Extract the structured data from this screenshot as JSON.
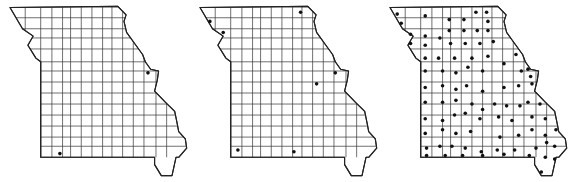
{
  "figure": {
    "title": "",
    "region": "Missouri counties",
    "colors": {
      "line": "#222222",
      "dot": "#111111",
      "background": "#ffffff"
    }
  },
  "maps": [
    {
      "name": "map-1",
      "occurrences": [
        {
          "lon": -90.6,
          "lat": 38.8,
          "label": "St. Charles area"
        },
        {
          "lon": -93.9,
          "lat": 36.6,
          "label": "Barry area"
        }
      ]
    },
    {
      "name": "map-2",
      "occurrences": [
        {
          "lon": -95.4,
          "lat": 40.2,
          "label": "Holt area"
        },
        {
          "lon": -94.9,
          "lat": 39.9,
          "label": "Andrew area"
        },
        {
          "lon": -92.0,
          "lat": 40.45,
          "label": "Scotland area"
        },
        {
          "lon": -90.7,
          "lat": 38.8,
          "label": "St. Charles area"
        },
        {
          "lon": -91.4,
          "lat": 38.5,
          "label": "Gasconade area"
        },
        {
          "lon": -94.35,
          "lat": 36.7,
          "label": "McDonald area"
        },
        {
          "lon": -92.25,
          "lat": 36.65,
          "label": "Ozark area"
        }
      ]
    },
    {
      "name": "map-3",
      "occurrences_grid": "dense",
      "occurrences": [
        {
          "lon": -95.5,
          "lat": 40.4
        },
        {
          "lon": -95.35,
          "lat": 40.15
        },
        {
          "lon": -94.45,
          "lat": 40.35
        },
        {
          "lon": -93.55,
          "lat": 40.25
        },
        {
          "lon": -93.0,
          "lat": 40.25
        },
        {
          "lon": -92.55,
          "lat": 40.45
        },
        {
          "lon": -92.15,
          "lat": 40.45
        },
        {
          "lon": -92.1,
          "lat": 40.2
        },
        {
          "lon": -93.55,
          "lat": 39.95
        },
        {
          "lon": -93.0,
          "lat": 39.95
        },
        {
          "lon": -92.5,
          "lat": 39.95
        },
        {
          "lon": -92.1,
          "lat": 39.95
        },
        {
          "lon": -95.0,
          "lat": 39.85
        },
        {
          "lon": -94.45,
          "lat": 39.8
        },
        {
          "lon": -93.9,
          "lat": 39.75
        },
        {
          "lon": -95.0,
          "lat": 39.6
        },
        {
          "lon": -94.45,
          "lat": 39.55
        },
        {
          "lon": -93.5,
          "lat": 39.6
        },
        {
          "lon": -92.95,
          "lat": 39.6
        },
        {
          "lon": -92.4,
          "lat": 39.6
        },
        {
          "lon": -91.9,
          "lat": 39.65
        },
        {
          "lon": -94.45,
          "lat": 39.2
        },
        {
          "lon": -93.95,
          "lat": 39.2
        },
        {
          "lon": -93.35,
          "lat": 39.2
        },
        {
          "lon": -92.7,
          "lat": 39.2
        },
        {
          "lon": -92.1,
          "lat": 39.25
        },
        {
          "lon": -91.5,
          "lat": 39.05
        },
        {
          "lon": -91.05,
          "lat": 39.3
        },
        {
          "lon": -94.45,
          "lat": 38.85
        },
        {
          "lon": -93.8,
          "lat": 38.85
        },
        {
          "lon": -93.3,
          "lat": 38.8
        },
        {
          "lon": -92.85,
          "lat": 38.95
        },
        {
          "lon": -92.3,
          "lat": 38.85
        },
        {
          "lon": -90.85,
          "lat": 38.85
        },
        {
          "lon": -90.6,
          "lat": 38.9
        },
        {
          "lon": -90.5,
          "lat": 38.7
        },
        {
          "lon": -94.45,
          "lat": 38.4
        },
        {
          "lon": -93.8,
          "lat": 38.45
        },
        {
          "lon": -93.3,
          "lat": 38.35
        },
        {
          "lon": -92.9,
          "lat": 38.45
        },
        {
          "lon": -92.3,
          "lat": 38.3
        },
        {
          "lon": -91.5,
          "lat": 38.4
        },
        {
          "lon": -90.95,
          "lat": 38.45
        },
        {
          "lon": -90.45,
          "lat": 38.5
        },
        {
          "lon": -94.45,
          "lat": 38.0
        },
        {
          "lon": -93.8,
          "lat": 38.0
        },
        {
          "lon": -93.3,
          "lat": 38.05
        },
        {
          "lon": -92.7,
          "lat": 37.95
        },
        {
          "lon": -92.3,
          "lat": 37.8
        },
        {
          "lon": -91.85,
          "lat": 37.95
        },
        {
          "lon": -91.4,
          "lat": 37.9
        },
        {
          "lon": -90.9,
          "lat": 37.9
        },
        {
          "lon": -90.6,
          "lat": 38.0
        },
        {
          "lon": -90.15,
          "lat": 37.95
        },
        {
          "lon": -94.45,
          "lat": 37.55
        },
        {
          "lon": -93.8,
          "lat": 37.5
        },
        {
          "lon": -93.35,
          "lat": 37.65
        },
        {
          "lon": -92.95,
          "lat": 37.7
        },
        {
          "lon": -92.4,
          "lat": 37.55
        },
        {
          "lon": -91.7,
          "lat": 37.6
        },
        {
          "lon": -91.2,
          "lat": 37.5
        },
        {
          "lon": -90.45,
          "lat": 37.6
        },
        {
          "lon": -89.95,
          "lat": 37.55
        },
        {
          "lon": -94.45,
          "lat": 37.15
        },
        {
          "lon": -93.8,
          "lat": 37.25
        },
        {
          "lon": -93.3,
          "lat": 37.15
        },
        {
          "lon": -92.75,
          "lat": 37.2
        },
        {
          "lon": -91.65,
          "lat": 37.05
        },
        {
          "lon": -90.95,
          "lat": 37.1
        },
        {
          "lon": -90.45,
          "lat": 37.25
        },
        {
          "lon": -89.95,
          "lat": 37.1
        },
        {
          "lon": -89.55,
          "lat": 37.25
        },
        {
          "lon": -94.4,
          "lat": 36.75
        },
        {
          "lon": -93.9,
          "lat": 36.8
        },
        {
          "lon": -93.45,
          "lat": 36.8
        },
        {
          "lon": -92.95,
          "lat": 36.75
        },
        {
          "lon": -92.35,
          "lat": 36.65
        },
        {
          "lon": -91.75,
          "lat": 36.7
        },
        {
          "lon": -91.1,
          "lat": 36.7
        },
        {
          "lon": -90.3,
          "lat": 36.75
        },
        {
          "lon": -89.9,
          "lat": 36.9
        },
        {
          "lon": -89.6,
          "lat": 36.8
        },
        {
          "lon": -94.4,
          "lat": 36.55
        },
        {
          "lon": -93.7,
          "lat": 36.55
        },
        {
          "lon": -93.05,
          "lat": 36.55
        },
        {
          "lon": -92.3,
          "lat": 36.55
        },
        {
          "lon": -91.5,
          "lat": 36.58
        },
        {
          "lon": -90.55,
          "lat": 36.55
        },
        {
          "lon": -89.95,
          "lat": 36.5
        },
        {
          "lon": -89.6,
          "lat": 36.45
        },
        {
          "lon": -90.1,
          "lat": 36.1
        }
      ]
    }
  ]
}
